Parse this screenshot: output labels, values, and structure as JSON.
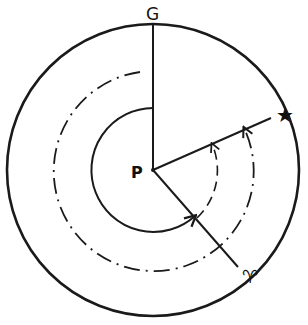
{
  "diagram": {
    "title": "",
    "labels": {
      "top": "G",
      "center": "P",
      "star": "★",
      "aries": "♈"
    },
    "colors": {
      "ink": "#1a1a1a",
      "background": "#ffffff"
    },
    "elements": {
      "outer_circle": "solid circle",
      "radius_to_G": "solid line",
      "radius_to_star": "solid line",
      "radius_to_aries": "solid line",
      "inner_arc": "solid arc with arrow",
      "dash_dot_arc": "dash-dot arc with arrow",
      "dashed_arc": "dashed arc with arrow"
    }
  }
}
